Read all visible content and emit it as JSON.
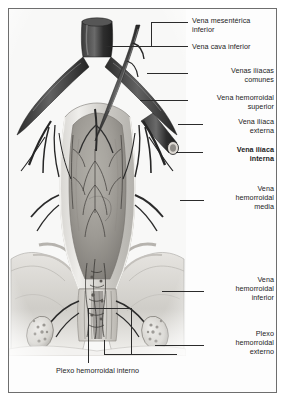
{
  "figure": {
    "type": "anatomical-illustration",
    "style": "grayscale halftone engraving",
    "frame_color": "#6e6e6e",
    "text_color": "#1c1c1c",
    "leader_color": "#2b2b2b"
  },
  "labels": {
    "right": [
      {
        "id": "vena-mesenterica-inferior",
        "text": "Vena mesentérica\ninferior",
        "emphasis": "normal"
      },
      {
        "id": "vena-cava-inferior",
        "text": "Vena cava  inferior",
        "emphasis": "normal"
      },
      {
        "id": "venas-iliacas-comunes",
        "text": "Venas ilíacas\ncomunes",
        "emphasis": "normal"
      },
      {
        "id": "vena-hemorroidal-superior",
        "text": "Vena hemorroidal\nsuperior",
        "emphasis": "normal"
      },
      {
        "id": "vena-iliaca-externa",
        "text": "Vena ilíaca\nexterna",
        "emphasis": "normal"
      },
      {
        "id": "vena-iliaca-interna",
        "text": "Vena ilíaca\ninterna",
        "emphasis": "bold"
      },
      {
        "id": "vena-hemorroidal-media",
        "text": "Vena\nhemorroidal\nmedia",
        "emphasis": "normal"
      },
      {
        "id": "vena-hemorroidal-inferior",
        "text": "Vena\nhemorroidal\ninferior",
        "emphasis": "normal"
      },
      {
        "id": "plexo-hemorroidal-externo",
        "text": "Plexo\nhemorroidal\nexterno",
        "emphasis": "normal"
      }
    ],
    "bottom": [
      {
        "id": "plexo-hemorroidal-interno",
        "text": "Plexo hemorroidal interno",
        "emphasis": "normal"
      }
    ]
  },
  "structures": [
    {
      "name": "vena-cava-inferior",
      "region": "superior-midline"
    },
    {
      "name": "vena-mesenterica-inferior",
      "region": "superior-right-oblique"
    },
    {
      "name": "vena-iliaca-comun-derecha",
      "region": "upper-left"
    },
    {
      "name": "vena-iliaca-comun-izquierda",
      "region": "upper-right"
    },
    {
      "name": "vena-hemorroidal-superior",
      "region": "midline-descending"
    },
    {
      "name": "vena-iliaca-externa",
      "region": "lateral-right"
    },
    {
      "name": "vena-iliaca-interna",
      "region": "lateral-right-branching"
    },
    {
      "name": "ampolla-rectal",
      "region": "center-opened"
    },
    {
      "name": "vena-hemorroidal-media",
      "region": "lateral-mid"
    },
    {
      "name": "conducto-anal",
      "region": "inferior-midline"
    },
    {
      "name": "plexo-hemorroidal-interno",
      "region": "anal-canal-submucosa"
    },
    {
      "name": "plexo-hemorroidal-externo",
      "region": "perianal-bilateral"
    },
    {
      "name": "musculo-elevador-del-ano",
      "region": "pelvic-floor"
    }
  ]
}
